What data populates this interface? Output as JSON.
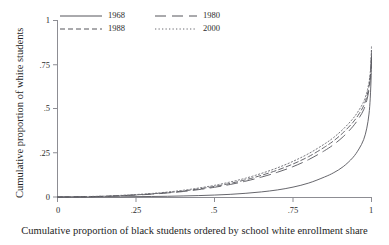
{
  "chart_data": {
    "type": "line",
    "title": "",
    "xlabel": "Cumulative proportion of black students ordered by school white enrollment share",
    "ylabel": "Cumulative proportion of white students",
    "xlim": [
      0,
      1
    ],
    "ylim": [
      0,
      1
    ],
    "xticks": [
      "0",
      ".25",
      ".5",
      ".75",
      "1"
    ],
    "xtick_values": [
      0,
      0.25,
      0.5,
      0.75,
      1
    ],
    "yticks": [
      "0",
      ".25",
      ".5",
      ".75",
      "1"
    ],
    "ytick_values": [
      0,
      0.25,
      0.5,
      0.75,
      1
    ],
    "grid": false,
    "legend_position": "top-left-inside",
    "series": [
      {
        "name": "1968",
        "style": "solid",
        "color": "#55555b",
        "x": [
          0.0,
          0.05,
          0.1,
          0.15,
          0.2,
          0.25,
          0.3,
          0.35,
          0.4,
          0.45,
          0.5,
          0.55,
          0.6,
          0.65,
          0.7,
          0.75,
          0.8,
          0.85,
          0.88,
          0.91,
          0.94,
          0.96,
          0.975,
          0.985,
          0.992,
          0.996,
          0.999,
          1.0
        ],
        "y": [
          0.0,
          0.0,
          0.0,
          0.001,
          0.001,
          0.002,
          0.003,
          0.004,
          0.006,
          0.008,
          0.011,
          0.015,
          0.021,
          0.029,
          0.04,
          0.056,
          0.079,
          0.113,
          0.138,
          0.172,
          0.222,
          0.272,
          0.325,
          0.39,
          0.47,
          0.56,
          0.69,
          0.8
        ]
      },
      {
        "name": "1980",
        "style": "long-dash",
        "color": "#55555b",
        "x": [
          0.0,
          0.05,
          0.1,
          0.15,
          0.2,
          0.25,
          0.3,
          0.35,
          0.4,
          0.45,
          0.5,
          0.55,
          0.6,
          0.65,
          0.7,
          0.75,
          0.8,
          0.85,
          0.88,
          0.91,
          0.94,
          0.96,
          0.975,
          0.985,
          0.992,
          0.996,
          0.999,
          1.0
        ],
        "y": [
          0.0,
          0.001,
          0.002,
          0.004,
          0.007,
          0.011,
          0.016,
          0.023,
          0.031,
          0.042,
          0.055,
          0.071,
          0.09,
          0.113,
          0.14,
          0.172,
          0.212,
          0.262,
          0.298,
          0.342,
          0.398,
          0.447,
          0.494,
          0.548,
          0.608,
          0.667,
          0.755,
          0.82
        ]
      },
      {
        "name": "1988",
        "style": "dash",
        "color": "#55555b",
        "x": [
          0.0,
          0.05,
          0.1,
          0.15,
          0.2,
          0.25,
          0.3,
          0.35,
          0.4,
          0.45,
          0.5,
          0.55,
          0.6,
          0.65,
          0.7,
          0.75,
          0.8,
          0.85,
          0.88,
          0.91,
          0.94,
          0.96,
          0.975,
          0.985,
          0.992,
          0.996,
          0.999,
          1.0
        ],
        "y": [
          0.0,
          0.001,
          0.002,
          0.004,
          0.008,
          0.012,
          0.018,
          0.025,
          0.034,
          0.046,
          0.06,
          0.077,
          0.098,
          0.123,
          0.152,
          0.187,
          0.229,
          0.282,
          0.319,
          0.365,
          0.421,
          0.47,
          0.517,
          0.57,
          0.628,
          0.684,
          0.768,
          0.83
        ]
      },
      {
        "name": "2000",
        "style": "dotted",
        "color": "#6a6a70",
        "x": [
          0.0,
          0.05,
          0.1,
          0.15,
          0.2,
          0.25,
          0.3,
          0.35,
          0.4,
          0.45,
          0.5,
          0.55,
          0.6,
          0.65,
          0.7,
          0.75,
          0.8,
          0.85,
          0.88,
          0.91,
          0.94,
          0.96,
          0.975,
          0.985,
          0.992,
          0.996,
          0.999,
          1.0
        ],
        "y": [
          0.0,
          0.001,
          0.003,
          0.005,
          0.009,
          0.014,
          0.02,
          0.028,
          0.038,
          0.051,
          0.066,
          0.085,
          0.107,
          0.134,
          0.165,
          0.202,
          0.246,
          0.3,
          0.338,
          0.385,
          0.442,
          0.492,
          0.54,
          0.593,
          0.65,
          0.705,
          0.79,
          0.86
        ]
      }
    ]
  },
  "legend": {
    "entries": [
      {
        "label": "1968",
        "style": "solid"
      },
      {
        "label": "1980",
        "style": "long-dash"
      },
      {
        "label": "1988",
        "style": "dash"
      },
      {
        "label": "2000",
        "style": "dotted"
      }
    ]
  },
  "axes": {
    "y_title": "Cumulative proportion of white students",
    "x_title": "Cumulative proportion of black students ordered by school white enrollment share",
    "y_tick_labels": [
      "1",
      ".75",
      ".5",
      ".25",
      "0"
    ],
    "x_tick_labels": [
      "0",
      ".25",
      ".5",
      ".75",
      "1"
    ]
  },
  "colors": {
    "axis": "#8d8d93",
    "line": "#55555b",
    "text": "#1d1d1d",
    "background": "#ffffff"
  }
}
